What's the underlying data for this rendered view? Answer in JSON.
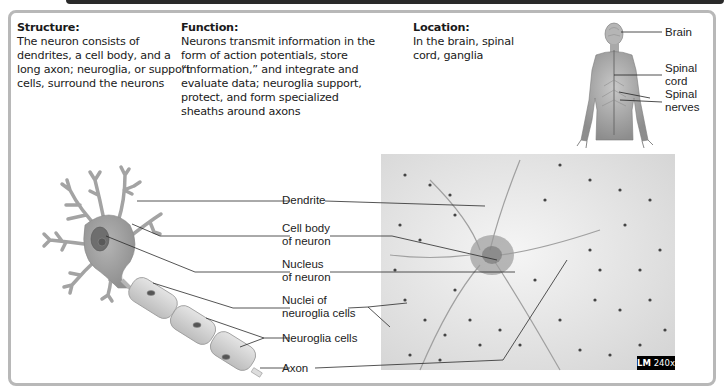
{
  "info": {
    "structure": {
      "heading": "Structure:",
      "text": "The neuron consists of dendrites, a cell body, and a long axon; neuroglia, or support cells, surround the neurons"
    },
    "function": {
      "heading": "Function:",
      "text": "Neurons transmit information in the form of action potentials, store “information,” and integrate and evaluate data; neuroglia support, protect, and form specialized sheaths around axons"
    },
    "location": {
      "heading": "Location:",
      "text": "In the brain, spinal cord, ganglia"
    }
  },
  "body_figure": {
    "labels": {
      "brain": "Brain",
      "spinal_cord_1": "Spinal",
      "spinal_cord_2": "cord",
      "spinal_nerves_1": "Spinal",
      "spinal_nerves_2": "nerves"
    }
  },
  "neuron_labels": {
    "dendrite": "Dendrite",
    "cell_body_1": "Cell body",
    "cell_body_2": "of neuron",
    "nucleus_1": "Nucleus",
    "nucleus_2": "of neuron",
    "nuclei_glia_1": "Nuclei of",
    "nuclei_glia_2": "neuroglia cells",
    "neuroglia": "Neuroglia cells",
    "axon": "Axon"
  },
  "micrograph": {
    "badge_prefix": "LM",
    "badge_mag": "240x"
  }
}
